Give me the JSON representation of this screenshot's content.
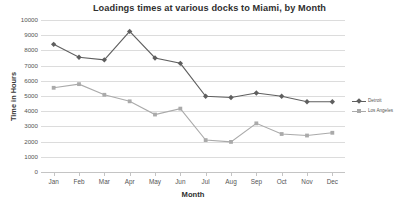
{
  "chart_data": {
    "type": "line",
    "title": "Loadings times at various docks to Miami, by Month",
    "xlabel": "Month",
    "ylabel": "Time in Hours",
    "categories": [
      "Jan",
      "Feb",
      "Mar",
      "Apr",
      "May",
      "Jun",
      "Jul",
      "Aug",
      "Sep",
      "Oct",
      "Nov",
      "Dec"
    ],
    "ylim": [
      0,
      10000
    ],
    "ytick_labels": [
      "10000",
      "9000",
      "8000",
      "7000",
      "6000",
      "5000",
      "4000",
      "3000",
      "2000",
      "1000",
      "0"
    ],
    "ytick_values": [
      10000,
      9000,
      8000,
      7000,
      6000,
      5000,
      4000,
      3000,
      2000,
      1000,
      0
    ],
    "ytick_step": 1000,
    "grid": "horizontal",
    "legend_position": "right",
    "series": [
      {
        "name": "Detroit",
        "color": "#5f5f5f",
        "marker": "diamond",
        "values": [
          8400,
          7550,
          7380,
          9250,
          7500,
          7150,
          4980,
          4900,
          5200,
          4980,
          4620,
          4620
        ]
      },
      {
        "name": "Los Angeles",
        "color": "#aaaaaa",
        "marker": "square",
        "values": [
          5540,
          5780,
          5080,
          4650,
          3780,
          4170,
          2100,
          1980,
          3200,
          2500,
          2400,
          2580
        ]
      }
    ]
  }
}
